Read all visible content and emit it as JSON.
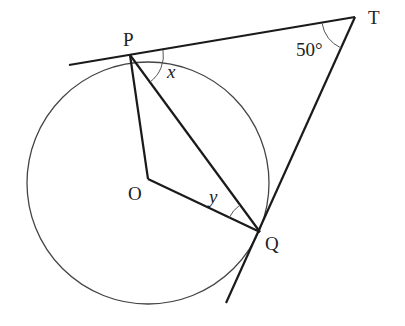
{
  "diagram": {
    "points": {
      "P": {
        "label": "P",
        "x": 130,
        "y": 55
      },
      "T": {
        "label": "T",
        "x": 355,
        "y": 17
      },
      "Q": {
        "label": "Q",
        "x": 260,
        "y": 232
      },
      "O": {
        "label": "O",
        "x": 148,
        "y": 182
      }
    },
    "circle": {
      "center": "O",
      "cx": 148,
      "cy": 183,
      "r": 121
    },
    "angles": {
      "T": {
        "label": "50°"
      },
      "x": {
        "label": "x"
      },
      "y": {
        "label": "y"
      }
    },
    "colors": {
      "line": "#1a1a1a",
      "circle": "#444444",
      "text": "#222222"
    }
  }
}
